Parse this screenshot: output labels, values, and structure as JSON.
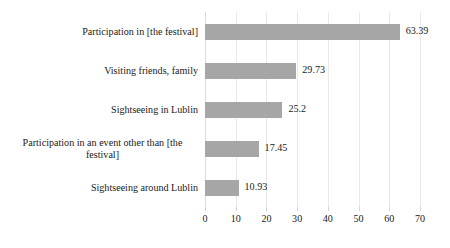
{
  "chart_data": {
    "type": "bar",
    "orientation": "horizontal",
    "title": "",
    "subtitle": "",
    "xlabel": "",
    "ylabel": "",
    "categories": [
      "Participation in [the festival]",
      "Visiting friends, family",
      "Sightseeing in Lublin",
      "Participation in an event other than [the festival]",
      "Sightseeing around Lublin"
    ],
    "values": [
      63.39,
      29.73,
      25.2,
      17.45,
      10.93
    ],
    "value_labels": [
      "63.39",
      "29.73",
      "25.2",
      "17.45",
      "10.93"
    ],
    "xlim": [
      0,
      70
    ],
    "xticks": [
      0,
      10,
      20,
      30,
      40,
      50,
      60,
      70
    ],
    "xticklabels": [
      "0",
      "10",
      "20",
      "30",
      "40",
      "50",
      "60",
      "70"
    ],
    "grid": true,
    "legend": null,
    "legend_position": "none",
    "bar_color": "#a6a6a6",
    "gridline_color": "#e9e9e9",
    "text_color": "#1a1a1a",
    "background_color": "#ffffff"
  }
}
